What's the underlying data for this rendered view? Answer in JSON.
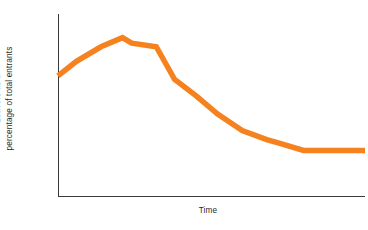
{
  "chart_data": {
    "type": "line",
    "title": "",
    "subtitle": "",
    "xlabel": "Time",
    "ylabel_line1": "Leavers as a",
    "ylabel_line2": "percentage of total entrants",
    "ylabel": "Leavers as a percentage of total entrants",
    "grid": false,
    "legend": false,
    "legend_position": "none",
    "x_tick_labels": [],
    "y_tick_labels": [],
    "xlim": [
      0,
      100
    ],
    "ylim": [
      0,
      100
    ],
    "series": [
      {
        "name": "Leavers as a percentage of total entrants",
        "color": "#F5821F",
        "line_width": 5.5,
        "x": [
          0,
          6,
          14,
          21,
          24,
          32,
          38,
          45,
          52,
          60,
          68,
          72,
          80,
          88,
          100
        ],
        "values": [
          66,
          74,
          82,
          87,
          84,
          82,
          64,
          55,
          45,
          36,
          31,
          29,
          25,
          25,
          25
        ]
      }
    ],
    "annotations": [],
    "axis_color": "#3a3a3a",
    "background_color": "#ffffff"
  },
  "geometry": {
    "plot_left": 58,
    "plot_right": 365,
    "plot_top": 14,
    "plot_bottom": 196
  }
}
